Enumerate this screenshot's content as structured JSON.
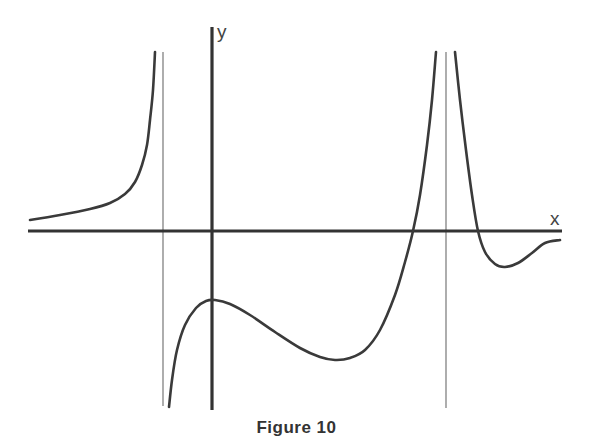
{
  "figure": {
    "caption": "Figure 10",
    "x_axis_label": "x",
    "y_axis_label": "y"
  },
  "colors": {
    "axis": "#333333",
    "asymptote": "#777777",
    "curve": "#3a3a3a",
    "background": "#ffffff"
  },
  "chart_data": {
    "type": "line",
    "title": "Figure 10",
    "xlabel": "x",
    "ylabel": "y",
    "grid": false,
    "legend": null,
    "tick_labels": [],
    "vertical_asymptotes_px": [
      163,
      446
    ],
    "axes_px": {
      "x_axis_y": 231,
      "y_axis_x": 212
    },
    "series": [
      {
        "name": "left-branch",
        "note": "approaches 0 from above as x→-∞, rises to +∞ at left asymptote",
        "points_px": [
          [
            30,
            220
          ],
          [
            60,
            215
          ],
          [
            90,
            209
          ],
          [
            110,
            203
          ],
          [
            125,
            194
          ],
          [
            135,
            182
          ],
          [
            142,
            165
          ],
          [
            147,
            145
          ],
          [
            150,
            120
          ],
          [
            153,
            90
          ],
          [
            155,
            52
          ]
        ]
      },
      {
        "name": "middle-branch",
        "note": "from -∞ at left asymptote, local max just right of y-axis (below x-axis), local min, crosses x-axis, to +∞ at right asymptote",
        "points_px": [
          [
            169,
            407
          ],
          [
            172,
            380
          ],
          [
            177,
            350
          ],
          [
            185,
            325
          ],
          [
            196,
            308
          ],
          [
            206,
            301
          ],
          [
            215,
            300
          ],
          [
            230,
            304
          ],
          [
            250,
            315
          ],
          [
            275,
            332
          ],
          [
            300,
            348
          ],
          [
            320,
            357
          ],
          [
            335,
            360
          ],
          [
            350,
            358
          ],
          [
            365,
            350
          ],
          [
            380,
            330
          ],
          [
            395,
            295
          ],
          [
            405,
            262
          ],
          [
            413,
            231
          ],
          [
            420,
            195
          ],
          [
            427,
            145
          ],
          [
            432,
            100
          ],
          [
            436,
            52
          ]
        ]
      },
      {
        "name": "right-branch",
        "note": "from +∞ at right asymptote, crosses x-axis, local min below axis, approaches 0 from below",
        "points_px": [
          [
            455,
            52
          ],
          [
            460,
            100
          ],
          [
            466,
            150
          ],
          [
            472,
            195
          ],
          [
            478,
            231
          ],
          [
            485,
            252
          ],
          [
            495,
            264
          ],
          [
            505,
            267
          ],
          [
            518,
            263
          ],
          [
            532,
            253
          ],
          [
            545,
            243
          ],
          [
            560,
            240
          ]
        ]
      }
    ]
  }
}
